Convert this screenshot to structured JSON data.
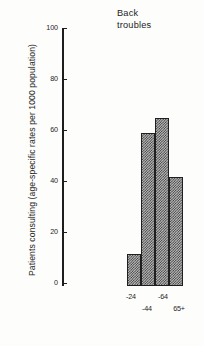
{
  "chart_data": {
    "type": "bar",
    "title": "Back troubles",
    "title_lines": [
      "Back",
      "troubles"
    ],
    "xlabel": "",
    "ylabel": "Patients consulting (age-specific rates per 1000 population)",
    "categories": [
      "-24",
      "-44",
      "-64",
      "65+"
    ],
    "values": [
      12,
      59,
      65,
      42
    ],
    "ylim": [
      0,
      100
    ],
    "yticks": [
      0,
      20,
      40,
      60,
      80,
      100
    ],
    "ytick_labels": [
      "0",
      "20",
      "40",
      "60",
      "80",
      "100"
    ],
    "grid": false,
    "legend": null,
    "bar_style": {
      "fill": "checkerboard-hatch",
      "edge_color": "#1f1f1f",
      "gap": 0
    },
    "xtick_layout": "staggered-two-row",
    "xtick_rows": {
      "top": [
        "-24",
        "",
        "-64",
        ""
      ],
      "bottom": [
        "",
        "-44",
        "",
        "65+"
      ]
    }
  }
}
